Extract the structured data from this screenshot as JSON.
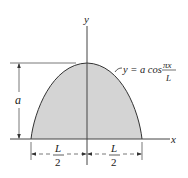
{
  "diagram": {
    "type": "area-under-cosine-curve",
    "axes": {
      "x_label": "x",
      "y_label": "y"
    },
    "curve": {
      "equation_lhs": "y = a cos",
      "equation_numerator": "πx",
      "equation_denominator": "L",
      "fill_color": "#d4d4d4",
      "stroke_color": "#333333"
    },
    "dimensions": {
      "height_label": "a",
      "left_half_numerator": "L",
      "left_half_denominator": "2",
      "right_half_numerator": "L",
      "right_half_denominator": "2"
    }
  }
}
